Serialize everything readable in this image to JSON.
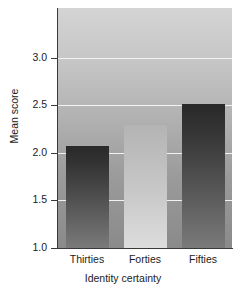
{
  "chart_data": {
    "type": "bar",
    "title": "",
    "categories": [
      "Thirties",
      "Forties",
      "Fifties"
    ],
    "values": [
      2.07,
      2.29,
      2.51
    ],
    "xlabel": "Identity certainty",
    "ylabel": "Mean score",
    "ylim": [
      1.0,
      3.52
    ],
    "yticks": [
      1.0,
      1.5,
      2.0,
      2.5,
      3.0
    ],
    "ytick_labels": [
      "1.0",
      "1.5",
      "2.0",
      "2.5",
      "3.0"
    ],
    "grid": true,
    "grid_color": "#f2f2f2",
    "legend": null,
    "series_styles": [
      "dark",
      "light",
      "dark"
    ],
    "colors": {
      "plot_background_top": "#d4d4d4",
      "plot_background_bottom": "#8a8a8a",
      "bar_dark_top": "#292929",
      "bar_dark_bottom": "#7a7a7a",
      "bar_light_top": "#b4b4b4",
      "bar_light_bottom": "#dcdcdc",
      "axis": "#3a3a3a",
      "text": "#1c1c1c"
    }
  }
}
